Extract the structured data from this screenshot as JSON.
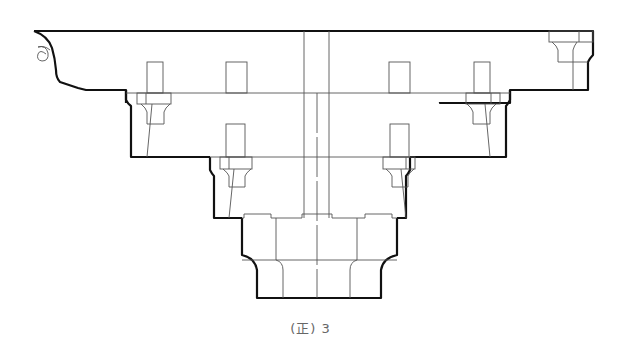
{
  "figure": {
    "caption": "(正) 3",
    "colors": {
      "outline": "#111111",
      "detail": "#555555",
      "background": "#ffffff"
    }
  }
}
